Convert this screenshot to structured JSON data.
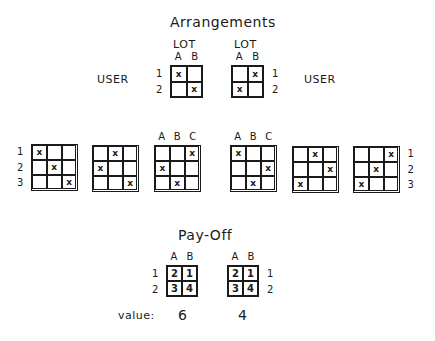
{
  "arrangements": {
    "title": "Arrangements",
    "top_left": {
      "lot_label": "LOT",
      "user_label": "USER",
      "cols": [
        "A",
        "B"
      ],
      "rows": [
        "1",
        "2"
      ],
      "cells": [
        [
          "x",
          ""
        ],
        [
          "",
          "x"
        ]
      ]
    },
    "top_right": {
      "lot_label": "LOT",
      "user_label": "USER",
      "cols": [
        "A",
        "B"
      ],
      "rows": [
        "1",
        "2"
      ],
      "cells": [
        [
          "",
          "x"
        ],
        [
          "x",
          ""
        ]
      ]
    },
    "three_by_three": [
      {
        "cols": [],
        "rows": [
          "1",
          "2",
          "3"
        ],
        "cells": [
          [
            "x",
            "",
            ""
          ],
          [
            "",
            "x",
            ""
          ],
          [
            "",
            "",
            "x"
          ]
        ]
      },
      {
        "cols": [],
        "rows": [],
        "cells": [
          [
            "",
            "x",
            ""
          ],
          [
            "x",
            "",
            ""
          ],
          [
            "",
            "",
            "x"
          ]
        ]
      },
      {
        "cols": [
          "A",
          "B",
          "C"
        ],
        "rows": [],
        "cells": [
          [
            "",
            "",
            "x"
          ],
          [
            "x",
            "",
            ""
          ],
          [
            "",
            "x",
            ""
          ]
        ]
      },
      {
        "cols": [
          "A",
          "B",
          "C"
        ],
        "rows": [],
        "cells": [
          [
            "x",
            "",
            ""
          ],
          [
            "",
            "",
            "x"
          ],
          [
            "",
            "x",
            ""
          ]
        ]
      },
      {
        "cols": [],
        "rows": [],
        "cells": [
          [
            "",
            "x",
            ""
          ],
          [
            "",
            "",
            "x"
          ],
          [
            "x",
            "",
            ""
          ]
        ]
      },
      {
        "cols": [],
        "rows": [
          "1",
          "2",
          "3"
        ],
        "cells": [
          [
            "",
            "",
            "x"
          ],
          [
            "",
            "x",
            ""
          ],
          [
            "x",
            "",
            ""
          ]
        ]
      }
    ]
  },
  "payoff": {
    "title": "Pay-Off",
    "left": {
      "cols": [
        "A",
        "B"
      ],
      "rows": [
        "1",
        "2"
      ],
      "cells": [
        [
          "2",
          "1"
        ],
        [
          "3",
          "4"
        ]
      ],
      "value": "6"
    },
    "right": {
      "cols": [
        "A",
        "B"
      ],
      "rows": [
        "1",
        "2"
      ],
      "cells": [
        [
          "2",
          "1"
        ],
        [
          "3",
          "4"
        ]
      ],
      "value": "4"
    },
    "value_label": "value:"
  }
}
